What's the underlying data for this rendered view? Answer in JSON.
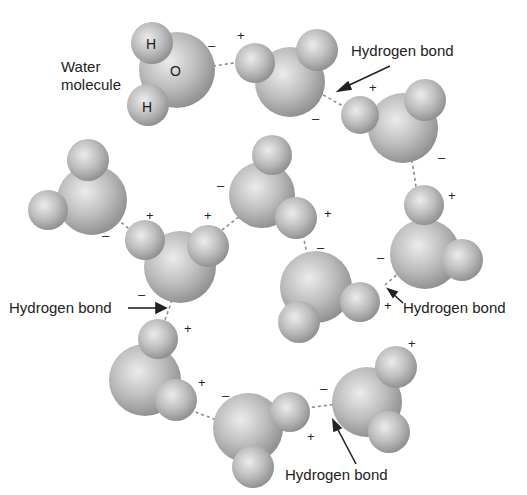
{
  "diagram": {
    "title_label": "Water molecule",
    "title_label_line1": "Water",
    "title_label_line2": "molecule",
    "atom_labels": {
      "hydrogen": "H",
      "oxygen": "O"
    },
    "charges": {
      "positive": "+",
      "negative": "–"
    },
    "callouts": [
      {
        "id": "hb-top-right",
        "text": "Hydrogen bond"
      },
      {
        "id": "hb-left",
        "text": "Hydrogen bond"
      },
      {
        "id": "hb-right",
        "text": "Hydrogen bond"
      },
      {
        "id": "hb-bottom",
        "text": "Hydrogen bond"
      }
    ],
    "colors": {
      "atom_light": "#e6e6e6",
      "atom_mid": "#b5b5b5",
      "atom_dark": "#8a8a8a",
      "bond_dash": "#8c8c8c",
      "text": "#222222"
    },
    "molecules_count": 10
  }
}
